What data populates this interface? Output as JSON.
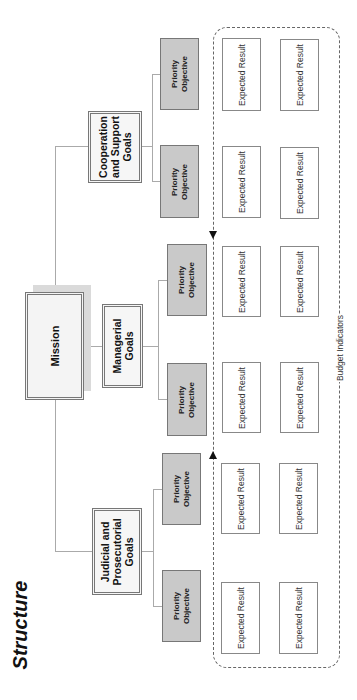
{
  "title": "Structure",
  "mission": {
    "label": "Mission"
  },
  "goals": [
    {
      "id": "cooperation",
      "label": "Cooperation and Support Goals",
      "lines": [
        "Cooperation",
        "and Support",
        "Goals"
      ]
    },
    {
      "id": "managerial",
      "label": "Managerial Goals",
      "lines": [
        "Managerial",
        "Goals"
      ]
    },
    {
      "id": "judicial",
      "label": "Judicial and Prosecutorial Goals",
      "lines": [
        "Judicial and",
        "Prosecutorial",
        "Goals"
      ]
    }
  ],
  "priority_objective": {
    "lines": [
      "Priority",
      "Objective"
    ]
  },
  "expected_result": {
    "label": "Expected Result"
  },
  "budget_indicators": {
    "label": "Budget Indicators"
  },
  "colors": {
    "priority_fill": "#c9c9c9",
    "goal_fill": "#f6f6f6",
    "mission_shadow": "#dadada",
    "connector": "#aaaaaa",
    "dashed_border": "#666666"
  }
}
